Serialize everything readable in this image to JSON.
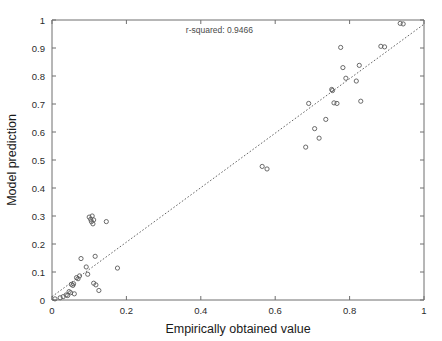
{
  "figure": {
    "width": 442,
    "height": 341,
    "background": "#ffffff"
  },
  "annotation": {
    "text": "r-squared: 0.9466"
  },
  "axes": {
    "x_title": "Empirically obtained value",
    "y_title": "Model prediction",
    "x_ticks": [
      "0",
      "0.2",
      "0.4",
      "0.6",
      "0.8",
      "1"
    ],
    "y_ticks": [
      "0",
      "0.1",
      "0.2",
      "0.3",
      "0.4",
      "0.5",
      "0.6",
      "0.7",
      "0.8",
      "0.9",
      "1"
    ]
  },
  "colors": {
    "frame": "#6f6f6f",
    "marker_stroke": "#5a5a5a",
    "trend_line": "#555555",
    "text": "#1a1a1a",
    "annotation_text": "#4a4a4a"
  },
  "chart_data": {
    "type": "scatter",
    "title": "",
    "subtitle": "",
    "xlabel": "Empirically obtained value",
    "ylabel": "Model prediction",
    "xlim": [
      0,
      1
    ],
    "ylim": [
      0,
      1
    ],
    "x_ticks": [
      0,
      0.2,
      0.4,
      0.6,
      0.8,
      1
    ],
    "y_ticks": [
      0,
      0.1,
      0.2,
      0.3,
      0.4,
      0.5,
      0.6,
      0.7,
      0.8,
      0.9,
      1
    ],
    "grid": false,
    "legend": "none",
    "marker": "open-circle",
    "annotations": [
      {
        "text": "r-squared: 0.9466",
        "x": 0.45,
        "y": 0.955
      }
    ],
    "r_squared": 0.9466,
    "trend_line": {
      "type": "identity-fit",
      "x0": 0.0,
      "y0": 0.012,
      "x1": 1.0,
      "y1": 0.985,
      "style": "dotted"
    },
    "series": [
      {
        "name": "observations",
        "points": [
          [
            0.008,
            0.004
          ],
          [
            0.022,
            0.008
          ],
          [
            0.03,
            0.012
          ],
          [
            0.038,
            0.018
          ],
          [
            0.042,
            0.016
          ],
          [
            0.046,
            0.03
          ],
          [
            0.05,
            0.026
          ],
          [
            0.052,
            0.056
          ],
          [
            0.056,
            0.052
          ],
          [
            0.058,
            0.058
          ],
          [
            0.06,
            0.022
          ],
          [
            0.066,
            0.08
          ],
          [
            0.07,
            0.076
          ],
          [
            0.074,
            0.086
          ],
          [
            0.078,
            0.148
          ],
          [
            0.092,
            0.118
          ],
          [
            0.096,
            0.092
          ],
          [
            0.1,
            0.296
          ],
          [
            0.104,
            0.288
          ],
          [
            0.106,
            0.28
          ],
          [
            0.108,
            0.3
          ],
          [
            0.11,
            0.272
          ],
          [
            0.112,
            0.286
          ],
          [
            0.112,
            0.06
          ],
          [
            0.116,
            0.156
          ],
          [
            0.118,
            0.054
          ],
          [
            0.126,
            0.034
          ],
          [
            0.146,
            0.28
          ],
          [
            0.176,
            0.114
          ],
          [
            0.565,
            0.477
          ],
          [
            0.578,
            0.468
          ],
          [
            0.682,
            0.546
          ],
          [
            0.69,
            0.702
          ],
          [
            0.706,
            0.612
          ],
          [
            0.718,
            0.578
          ],
          [
            0.736,
            0.645
          ],
          [
            0.752,
            0.752
          ],
          [
            0.754,
            0.748
          ],
          [
            0.758,
            0.704
          ],
          [
            0.766,
            0.702
          ],
          [
            0.776,
            0.902
          ],
          [
            0.782,
            0.83
          ],
          [
            0.79,
            0.792
          ],
          [
            0.818,
            0.782
          ],
          [
            0.826,
            0.838
          ],
          [
            0.83,
            0.71
          ],
          [
            0.884,
            0.906
          ],
          [
            0.894,
            0.904
          ],
          [
            0.936,
            0.988
          ],
          [
            0.944,
            0.986
          ]
        ]
      }
    ]
  }
}
